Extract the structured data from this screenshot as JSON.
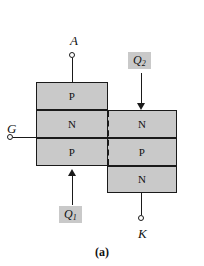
{
  "figure": {
    "caption": "(a)",
    "fill_color": "#c9c9c9",
    "line_color": "#1a1a1a",
    "background_color": "#ffffff"
  },
  "terminals": [
    {
      "id": "anode",
      "label": "A",
      "name": "terminal-a"
    },
    {
      "id": "gate",
      "label": "G",
      "name": "terminal-g"
    },
    {
      "id": "cathode",
      "label": "K",
      "name": "terminal-k"
    }
  ],
  "left_stack": {
    "name": "left-semiconductor-stack",
    "layers": [
      {
        "type": "P",
        "name": "layer-left-p-top"
      },
      {
        "type": "N",
        "name": "layer-left-n"
      },
      {
        "type": "P",
        "name": "layer-left-p-bottom"
      }
    ]
  },
  "right_stack": {
    "name": "right-semiconductor-stack",
    "layers": [
      {
        "type": "N",
        "name": "layer-right-n-top"
      },
      {
        "type": "P",
        "name": "layer-right-p"
      },
      {
        "type": "N",
        "name": "layer-right-n-bottom"
      }
    ]
  },
  "transistor_labels": [
    {
      "base": "Q",
      "sub": "1",
      "name": "label-q1",
      "arrow": "up"
    },
    {
      "base": "Q",
      "sub": "2",
      "name": "label-q2",
      "arrow": "down"
    }
  ]
}
